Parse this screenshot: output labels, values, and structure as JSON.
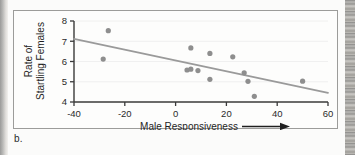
{
  "figure": {
    "caption": "b."
  },
  "chart_data": {
    "type": "scatter",
    "title": "",
    "xlabel": "Male Responsiveness",
    "xlabel_arrow": "⟶",
    "ylabel": "Rate of\nStartling Females",
    "ylabel_line1": "Rate of",
    "ylabel_line2": "Startling Females",
    "xlim": [
      -40,
      60
    ],
    "ylim": [
      4,
      8
    ],
    "xticks": [
      -40,
      -20,
      0,
      20,
      40,
      60
    ],
    "xtick_labels": [
      "-40",
      "-20",
      "0",
      "20",
      "40",
      "60"
    ],
    "yticks": [
      4,
      5,
      6,
      7,
      8
    ],
    "ytick_labels": [
      "4",
      "5",
      "6",
      "7",
      "8"
    ],
    "grid": false,
    "legend": "none",
    "marker_color": "#8e8e8e",
    "line_color": "#9a9a9a",
    "axis_color": "#3a3a3a",
    "points": [
      {
        "x": -28.5,
        "y": 6.12
      },
      {
        "x": -26.5,
        "y": 7.52
      },
      {
        "x": 4.5,
        "y": 5.58
      },
      {
        "x": 6.0,
        "y": 5.62
      },
      {
        "x": 6.0,
        "y": 6.67
      },
      {
        "x": 8.8,
        "y": 5.55
      },
      {
        "x": 13.5,
        "y": 6.4
      },
      {
        "x": 13.5,
        "y": 5.12
      },
      {
        "x": 22.5,
        "y": 6.23
      },
      {
        "x": 27.0,
        "y": 5.44
      },
      {
        "x": 28.5,
        "y": 5.02
      },
      {
        "x": 31.0,
        "y": 4.28
      },
      {
        "x": 50.0,
        "y": 5.03
      }
    ],
    "trend_line": {
      "x0": -40,
      "y0": 7.12,
      "x1": 60,
      "y1": 4.45
    }
  }
}
